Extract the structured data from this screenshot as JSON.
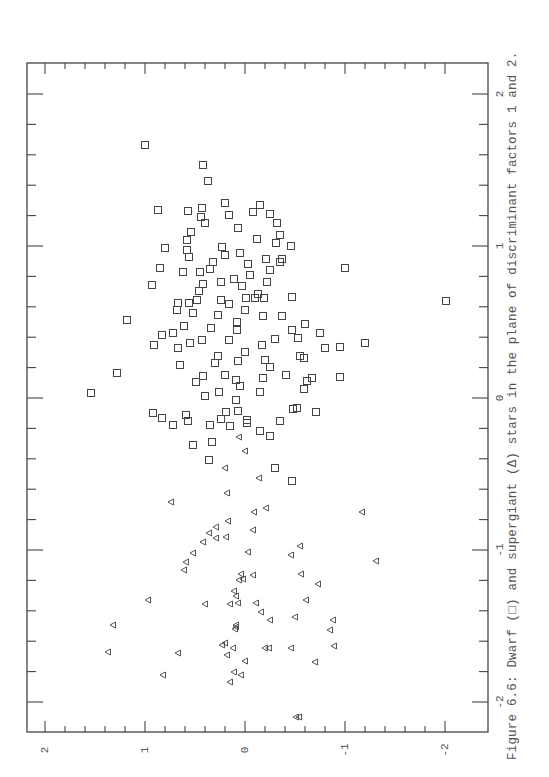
{
  "caption": "Figure 6.6: Dwarf  (□)  and supergiant  (Δ)  stars in the plane of discriminant factors 1 and 2.",
  "chart_data": {
    "type": "scatter",
    "xlabel": "Discriminant factor 1",
    "ylabel": "Discriminant factor 2",
    "orientation": "rotated 90 degrees (factor 1 runs vertically on page, factor 2 horizontally)",
    "factor1_ticks": [
      "2",
      "1",
      "0",
      "-1",
      "-2"
    ],
    "factor2_ticks": [
      "2",
      "1",
      "0",
      "-1",
      "-2"
    ],
    "factor1_range": [
      -2.2,
      2.2
    ],
    "factor2_range": [
      -2.2,
      2.2
    ],
    "grid": false,
    "legend": [
      {
        "name": "Dwarf",
        "marker": "square"
      },
      {
        "name": "Supergiant",
        "marker": "triangle"
      }
    ],
    "page_mapping": {
      "factor2_zero_x": 245,
      "factor2_px_per_unit": -100,
      "factor1_zero_y": 398,
      "factor1_px_per_unit": -152
    },
    "series": [
      {
        "name": "Dwarf",
        "marker": "square",
        "page_points": [
          [
            145,
            145
          ],
          [
            203,
            165
          ],
          [
            208,
            181
          ],
          [
            225,
            203
          ],
          [
            260,
            205
          ],
          [
            201,
            217
          ],
          [
            277,
            223
          ],
          [
            280,
            235
          ],
          [
            257,
            239
          ],
          [
            91,
            393
          ],
          [
            188,
            211
          ],
          [
            158,
            210
          ],
          [
            191,
            232
          ],
          [
            187,
            240
          ],
          [
            165,
            248
          ],
          [
            160,
            268
          ],
          [
            152,
            285
          ],
          [
            127,
            320
          ],
          [
            205,
            223
          ],
          [
            238,
            228
          ],
          [
            222,
            247
          ],
          [
            240,
            253
          ],
          [
            189,
            257
          ],
          [
            225,
            255
          ],
          [
            213,
            262
          ],
          [
            200,
            272
          ],
          [
            248,
            264
          ],
          [
            266,
            259
          ],
          [
            210,
            269
          ],
          [
            221,
            282
          ],
          [
            183,
            272
          ],
          [
            203,
            284
          ],
          [
            199,
            291
          ],
          [
            234,
            279
          ],
          [
            242,
            286
          ],
          [
            250,
            275
          ],
          [
            270,
            270
          ],
          [
            291,
            246
          ],
          [
            276,
            243
          ],
          [
            282,
            259
          ],
          [
            267,
            282
          ],
          [
            280,
            262
          ],
          [
            258,
            294
          ],
          [
            246,
            298
          ],
          [
            197,
            300
          ],
          [
            221,
            300
          ],
          [
            229,
            304
          ],
          [
            245,
            310
          ],
          [
            255,
            298
          ],
          [
            237,
            322
          ],
          [
            178,
            303
          ],
          [
            189,
            303
          ],
          [
            218,
            315
          ],
          [
            264,
            298
          ],
          [
            292,
            297
          ],
          [
            282,
            316
          ],
          [
            263,
            316
          ],
          [
            292,
            330
          ],
          [
            262,
            345
          ],
          [
            275,
            339
          ],
          [
            237,
            330
          ],
          [
            229,
            340
          ],
          [
            211,
            328
          ],
          [
            193,
            313
          ],
          [
            177,
            310
          ],
          [
            173,
            333
          ],
          [
            184,
            326
          ],
          [
            202,
            340
          ],
          [
            218,
            356
          ],
          [
            190,
            343
          ],
          [
            215,
            363
          ],
          [
            238,
            361
          ],
          [
            245,
            352
          ],
          [
            270,
            367
          ],
          [
            225,
            375
          ],
          [
            203,
            376
          ],
          [
            236,
            380
          ],
          [
            205,
            396
          ],
          [
            236,
            400
          ],
          [
            226,
            412
          ],
          [
            178,
            348
          ],
          [
            162,
            335
          ],
          [
            154,
            345
          ],
          [
            180,
            365
          ],
          [
            219,
            392
          ],
          [
            240,
            386
          ],
          [
            260,
            392
          ],
          [
            263,
            378
          ],
          [
            265,
            360
          ],
          [
            286,
            375
          ],
          [
            300,
            356
          ],
          [
            304,
            358
          ],
          [
            298,
            338
          ],
          [
            305,
            324
          ],
          [
            320,
            333
          ],
          [
            340,
            347
          ],
          [
            325,
            348
          ],
          [
            340,
            377
          ],
          [
            312,
            378
          ],
          [
            297,
            408
          ],
          [
            345,
            268
          ],
          [
            365,
            343
          ],
          [
            446,
            301
          ],
          [
            187,
            250
          ],
          [
            202,
            208
          ],
          [
            253,
            212
          ],
          [
            229,
            215
          ],
          [
            270,
            214
          ],
          [
            304,
            389
          ],
          [
            292,
            481
          ],
          [
            212,
            442
          ],
          [
            209,
            460
          ],
          [
            210,
            425
          ],
          [
            221,
            419
          ],
          [
            238,
            411
          ],
          [
            188,
            421
          ],
          [
            230,
            426
          ],
          [
            247,
            423
          ],
          [
            260,
            431
          ],
          [
            270,
            436
          ],
          [
            280,
            421
          ],
          [
            316,
            412
          ],
          [
            193,
            445
          ],
          [
            173,
            425
          ],
          [
            162,
            418
          ],
          [
            153,
            413
          ],
          [
            275,
            468
          ],
          [
            247,
            420
          ],
          [
            293,
            409
          ],
          [
            196,
            382
          ],
          [
            117,
            373
          ],
          [
            186,
            415
          ],
          [
            307,
            381
          ]
        ]
      },
      {
        "name": "Supergiant",
        "marker": "triangle",
        "page_points": [
          [
            239,
            437
          ],
          [
            245,
            451
          ],
          [
            225,
            468
          ],
          [
            227,
            493
          ],
          [
            259,
            478
          ],
          [
            171,
            502
          ],
          [
            254,
            512
          ],
          [
            216,
            527
          ],
          [
            228,
            521
          ],
          [
            266,
            508
          ],
          [
            216,
            538
          ],
          [
            209,
            533
          ],
          [
            253,
            530
          ],
          [
            248,
            552
          ],
          [
            226,
            537
          ],
          [
            203,
            542
          ],
          [
            193,
            553
          ],
          [
            300,
            546
          ],
          [
            376,
            561
          ],
          [
            291,
            555
          ],
          [
            186,
            562
          ],
          [
            184,
            570
          ],
          [
            241,
            574
          ],
          [
            243,
            579
          ],
          [
            301,
            574
          ],
          [
            253,
            575
          ],
          [
            234,
            591
          ],
          [
            239,
            580
          ],
          [
            148,
            600
          ],
          [
            113,
            625
          ],
          [
            318,
            584
          ],
          [
            362,
            512
          ],
          [
            236,
            596
          ],
          [
            230,
            604
          ],
          [
            238,
            603
          ],
          [
            256,
            603
          ],
          [
            306,
            600
          ],
          [
            261,
            612
          ],
          [
            270,
            620
          ],
          [
            333,
            620
          ],
          [
            205,
            604
          ],
          [
            295,
            617
          ],
          [
            330,
            630
          ],
          [
            236,
            625
          ],
          [
            235,
            629
          ],
          [
            236,
            627
          ],
          [
            225,
            643
          ],
          [
            222,
            645
          ],
          [
            233,
            648
          ],
          [
            265,
            648
          ],
          [
            178,
            653
          ],
          [
            108,
            652
          ],
          [
            291,
            648
          ],
          [
            334,
            646
          ],
          [
            315,
            662
          ],
          [
            227,
            655
          ],
          [
            245,
            661
          ],
          [
            269,
            648
          ],
          [
            234,
            672
          ],
          [
            230,
            682
          ],
          [
            163,
            675
          ],
          [
            241,
            675
          ],
          [
            296,
            717
          ],
          [
            299,
            717
          ]
        ]
      }
    ]
  },
  "axes": {
    "left_labels": [],
    "right_labels": [
      "2",
      "1",
      "0",
      "-1",
      "-2"
    ],
    "bottom_labels": [
      "2",
      "1",
      "0",
      "-1",
      "-2"
    ]
  }
}
